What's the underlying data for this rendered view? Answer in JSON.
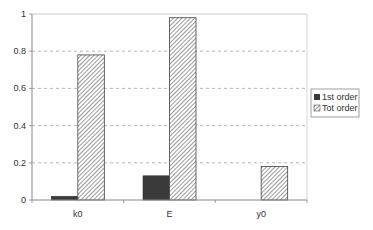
{
  "chart_data": {
    "type": "bar",
    "title": "",
    "xlabel": "",
    "ylabel": "",
    "categories": [
      "k0",
      "E",
      "y0"
    ],
    "series": [
      {
        "name": "1st order",
        "values": [
          0.02,
          0.13,
          0.0
        ],
        "fill": "solid",
        "color": "#3a3a3a"
      },
      {
        "name": "Tot order",
        "values": [
          0.78,
          0.98,
          0.18
        ],
        "fill": "hatch",
        "color": "#555555"
      }
    ],
    "ylim": [
      0,
      1
    ],
    "yticks": [
      0,
      0.2,
      0.4,
      0.6,
      0.8,
      1
    ],
    "ytick_labels": [
      "0",
      "0.2",
      "0.4",
      "0.6",
      "0.8",
      "1"
    ],
    "grid": "horizontal-dashed",
    "legend_position": "right"
  },
  "colors": {
    "axis": "#888888",
    "grid": "#999999",
    "solid_bar": "#3a3a3a",
    "hatch_line": "#555555"
  }
}
